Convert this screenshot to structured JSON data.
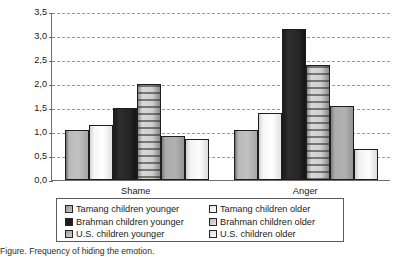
{
  "chart_data": {
    "type": "bar",
    "title": "",
    "xlabel": "",
    "ylabel": "Frequency of hiding the emotion",
    "ylim": [
      0.0,
      3.5
    ],
    "ytick_labels": [
      "3,5",
      "3,0",
      "2,5",
      "2,0",
      "1,5",
      "1,0",
      "0,5",
      "0,0"
    ],
    "ytick_values": [
      3.5,
      3.0,
      2.5,
      2.0,
      1.5,
      1.0,
      0.5,
      0.0
    ],
    "grid": true,
    "grid_style": "dashed-horizontal",
    "legend_position": "bottom",
    "categories": [
      "Shame",
      "Anger"
    ],
    "series": [
      {
        "name": "Tamang children younger",
        "values": [
          1.05,
          1.05
        ]
      },
      {
        "name": "Tamang children older",
        "values": [
          1.15,
          1.4
        ]
      },
      {
        "name": "Brahman children younger",
        "values": [
          1.5,
          3.15
        ]
      },
      {
        "name": "Brahman children older",
        "values": [
          2.0,
          2.4
        ]
      },
      {
        "name": "U.S. children younger",
        "values": [
          0.92,
          1.55
        ]
      },
      {
        "name": "U.S. children older",
        "values": [
          0.85,
          0.65
        ]
      }
    ]
  },
  "legend": {
    "left_column": [
      "Tamang children younger",
      "Brahman children younger",
      "U.S. children younger"
    ],
    "right_column": [
      "Tamang children older",
      "Brahman children older",
      "U.S. children older"
    ]
  },
  "caption": {
    "text": "Figure. Frequency of hiding the emotion."
  },
  "colors": {
    "axis": "#6d6d6d",
    "grid": "#9a9a9a",
    "bar_outline": "#1d1d1d",
    "text": "#1a1a1a"
  }
}
